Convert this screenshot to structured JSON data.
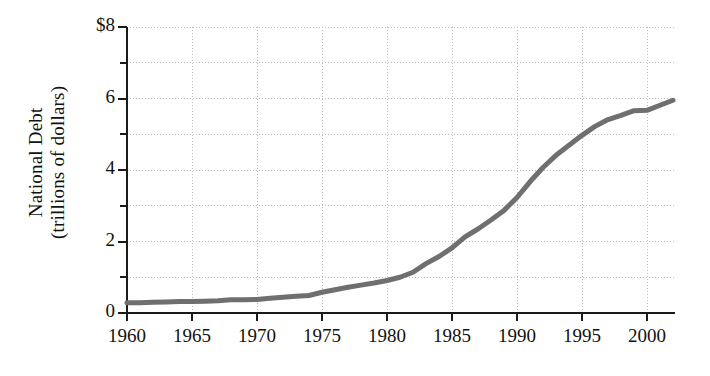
{
  "chart_data": {
    "type": "line",
    "title": "",
    "subtitle": "",
    "xlabel": "",
    "ylabel": "National Debt (trillions of dollars)",
    "ylabel_lines": [
      "National Debt",
      "(trillions of dollars)"
    ],
    "x_unit": "year",
    "y_unit": "trillions of dollars",
    "currency_symbol": "$",
    "xlim": [
      1960,
      2002
    ],
    "ylim": [
      0,
      8
    ],
    "grid": true,
    "grid_style": "dotted",
    "legend": false,
    "legend_position": "none",
    "x_tick_labels": [
      "1960",
      "1965",
      "1970",
      "1975",
      "1980",
      "1985",
      "1990",
      "1995",
      "2000"
    ],
    "x_ticks": [
      1960,
      1965,
      1970,
      1975,
      1980,
      1985,
      1990,
      1995,
      2000
    ],
    "x_tick_step": 5,
    "y_tick_labels": [
      "0",
      "",
      "2",
      "",
      "4",
      "",
      "6",
      "",
      "$8"
    ],
    "y_ticks": [
      0,
      1,
      2,
      3,
      4,
      5,
      6,
      7,
      8
    ],
    "y_major_labeled": [
      0,
      2,
      4,
      6,
      8
    ],
    "y_tick_step": 1,
    "line_color": "#6f6f6f",
    "axis_color": "#1a1a1a",
    "grid_color": "#bdbdbd",
    "background_color": "#ffffff",
    "line_width": 5,
    "series": [
      {
        "name": "National Debt",
        "x": [
          1960,
          1961,
          1962,
          1963,
          1964,
          1965,
          1966,
          1967,
          1968,
          1969,
          1970,
          1971,
          1972,
          1973,
          1974,
          1975,
          1976,
          1977,
          1978,
          1979,
          1980,
          1981,
          1982,
          1983,
          1984,
          1985,
          1986,
          1987,
          1988,
          1989,
          1990,
          1991,
          1992,
          1993,
          1994,
          1995,
          1996,
          1997,
          1998,
          1999,
          2000,
          2001,
          2002
        ],
        "values": [
          0.29,
          0.29,
          0.3,
          0.31,
          0.32,
          0.32,
          0.33,
          0.34,
          0.37,
          0.37,
          0.38,
          0.41,
          0.44,
          0.47,
          0.49,
          0.58,
          0.65,
          0.72,
          0.78,
          0.84,
          0.91,
          1.0,
          1.14,
          1.38,
          1.58,
          1.82,
          2.13,
          2.35,
          2.6,
          2.87,
          3.23,
          3.67,
          4.07,
          4.41,
          4.69,
          4.97,
          5.22,
          5.41,
          5.53,
          5.66,
          5.67,
          5.81,
          5.95
        ]
      }
    ],
    "annotations": []
  },
  "axis": {
    "y_title_line1": "National Debt",
    "y_title_line2": "(trillions of dollars)"
  }
}
